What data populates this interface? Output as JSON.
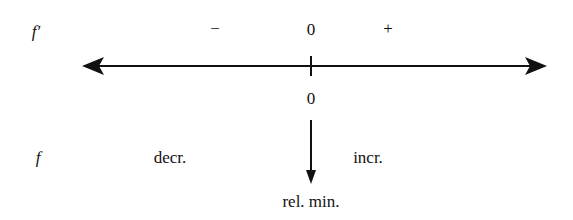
{
  "rows": {
    "derivative": {
      "label": "f′",
      "signs": {
        "left": "−",
        "critical": "0",
        "right": "+"
      }
    },
    "function": {
      "label": "f",
      "left_behavior": "decr.",
      "right_behavior": "incr."
    }
  },
  "number_line": {
    "critical_value": "0",
    "critical_label": "rel. min."
  },
  "colors": {
    "ink": "#111111",
    "background": "#ffffff"
  }
}
